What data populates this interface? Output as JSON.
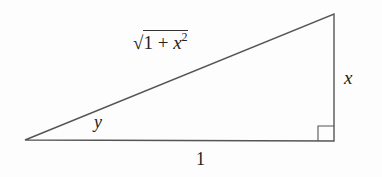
{
  "diagram": {
    "type": "right-triangle",
    "vertices": {
      "left": [
        25,
        140
      ],
      "right_angle": [
        334,
        141
      ],
      "top": [
        334,
        14
      ]
    },
    "line_color": "#555555",
    "labels": {
      "hypotenuse": {
        "prefix": "√",
        "base": "1 + x",
        "exponent": "2"
      },
      "opposite_side": "x",
      "angle": "y",
      "adjacent_side": "1"
    },
    "right_angle_marker": true
  }
}
